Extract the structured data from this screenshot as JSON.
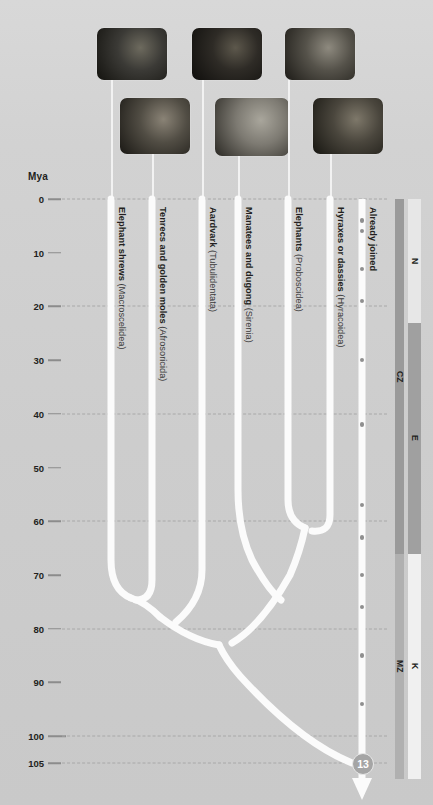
{
  "axis": {
    "unit_label": "Mya",
    "ticks": [
      0,
      10,
      20,
      30,
      40,
      50,
      60,
      70,
      80,
      90,
      100,
      105
    ],
    "gridline_values": [
      0,
      20,
      40,
      60,
      80,
      100,
      105
    ],
    "range": [
      0,
      108
    ]
  },
  "taxa": [
    {
      "common": "Elephant shrews",
      "order": "(Macroscelidea)",
      "x": 111,
      "tip_age": 0
    },
    {
      "common": "Tenrecs and golden moles",
      "order": "(Afrosoricida)",
      "x": 152,
      "tip_age": 0
    },
    {
      "common": "Aardvark",
      "order": "(Tubulidentata)",
      "x": 202,
      "tip_age": 0
    },
    {
      "common": "Manatees and dugong",
      "order": "(Sirenia)",
      "x": 238,
      "tip_age": 0
    },
    {
      "common": "Elephants",
      "order": "(Proboscidea)",
      "x": 288,
      "tip_age": 0
    },
    {
      "common": "Hyraxes or dassies",
      "order": "(Hyracoidea)",
      "x": 330,
      "tip_age": 0
    }
  ],
  "nodes": [
    {
      "name": "Macroscelidea + Afrosoricida",
      "age": 71,
      "x": 131
    },
    {
      "name": "Afroinsectiphilia",
      "age": 78,
      "x": 166
    },
    {
      "name": "Proboscidea + Hyracoidea",
      "age": 58,
      "x": 309
    },
    {
      "name": "Paenungulata",
      "age": 64,
      "x": 273
    },
    {
      "name": "Afrotheria root",
      "age": 80.5,
      "x": 219
    }
  ],
  "root": {
    "badge": "13",
    "age": 105,
    "x": 362
  },
  "already_joined": {
    "label": "Already joined",
    "x": 362,
    "dot_ages": [
      4,
      6,
      13,
      19,
      30,
      42,
      57,
      63,
      70,
      76,
      85,
      94
    ]
  },
  "geology": {
    "era_column": [
      {
        "label": "CZ",
        "from": 0,
        "to": 66,
        "color": "#9a9a9a"
      },
      {
        "label": "MZ",
        "from": 66,
        "to": 108,
        "color": "#b0b0b0"
      }
    ],
    "period_column": [
      {
        "label": "N",
        "from": 0,
        "to": 23,
        "color": "#e7e7e7"
      },
      {
        "label": "E",
        "from": 23,
        "to": 66,
        "color": "#a0a0a0"
      },
      {
        "label": "K",
        "from": 66,
        "to": 108,
        "color": "#f0f0f0"
      }
    ]
  },
  "photos": [
    {
      "name": "elephant-shrew-photo",
      "left": 97,
      "top": 28,
      "w": 70,
      "h": 52,
      "leader_x": 111,
      "leader_top": 80,
      "leader_h": 118,
      "g1": "#3b3a36",
      "g2": "#14130f",
      "g3": "#6d6a5e"
    },
    {
      "name": "tenrec-photo",
      "left": 120,
      "top": 98,
      "w": 70,
      "h": 56,
      "leader_x": 152,
      "leader_top": 154,
      "leader_h": 44,
      "g1": "#514d44",
      "g2": "#1a1814",
      "g3": "#8a8376"
    },
    {
      "name": "aardvark-photo",
      "left": 192,
      "top": 28,
      "w": 70,
      "h": 52,
      "leader_x": 202,
      "leader_top": 80,
      "leader_h": 118,
      "g1": "#2e2b26",
      "g2": "#0f0e0c",
      "g3": "#5d584c"
    },
    {
      "name": "manatee-photo",
      "left": 215,
      "top": 98,
      "w": 74,
      "h": 58,
      "leader_x": 238,
      "leader_top": 156,
      "leader_h": 42,
      "g1": "#7d7a72",
      "g2": "#2b2924",
      "g3": "#a9a69c"
    },
    {
      "name": "elephant-photo",
      "left": 285,
      "top": 28,
      "w": 70,
      "h": 52,
      "leader_x": 288,
      "leader_top": 80,
      "leader_h": 118,
      "g1": "#55524a",
      "g2": "#1d1b17",
      "g3": "#8e8a7f"
    },
    {
      "name": "hyrax-photo",
      "left": 313,
      "top": 98,
      "w": 70,
      "h": 56,
      "leader_x": 330,
      "leader_top": 154,
      "leader_h": 44,
      "g1": "#4a463d",
      "g2": "#171611",
      "g3": "#7e786a"
    }
  ]
}
